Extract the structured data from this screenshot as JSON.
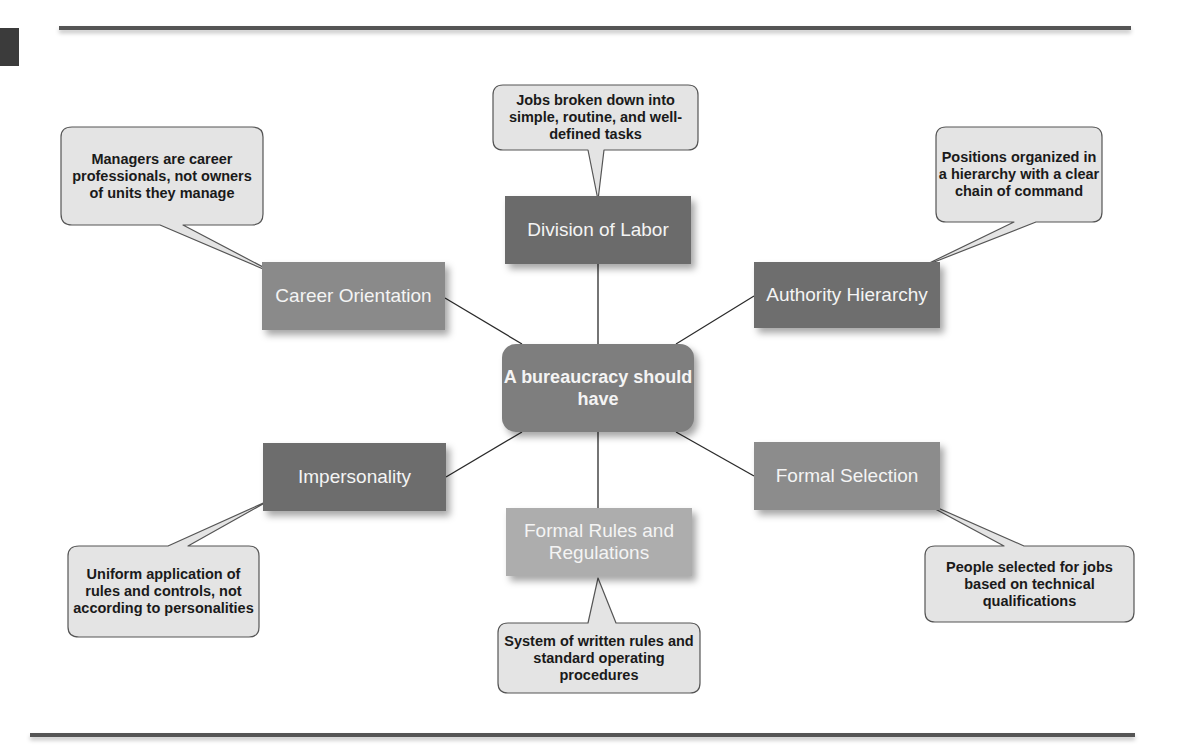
{
  "colors": {
    "dark_box": "#6b6b6b",
    "mid_box": "#8a8a8a",
    "light_box": "#adadad",
    "center_box": "#7e7e7e",
    "bubble_fill": "#e4e4e4",
    "bubble_stroke": "#555555",
    "rule": "#555555"
  },
  "center": {
    "label": "A bureaucracy should have"
  },
  "nodes": [
    {
      "id": "division",
      "label": "Division of Labor",
      "bubble": "Jobs broken down into simple, routine, and well-defined tasks"
    },
    {
      "id": "authority",
      "label": "Authority Hierarchy",
      "bubble": "Positions organized in a hierarchy with a clear chain of command"
    },
    {
      "id": "selection",
      "label": "Formal Selection",
      "bubble": "People selected for jobs based on technical qualifications"
    },
    {
      "id": "rules",
      "label": "Formal Rules and Regulations",
      "bubble": "System of written rules and standard operating procedures"
    },
    {
      "id": "impersonality",
      "label": "Impersonality",
      "bubble": "Uniform application of rules and controls, not according to personalities"
    },
    {
      "id": "career",
      "label": "Career Orientation",
      "bubble": "Managers are career professionals, not owners of units they manage"
    }
  ]
}
